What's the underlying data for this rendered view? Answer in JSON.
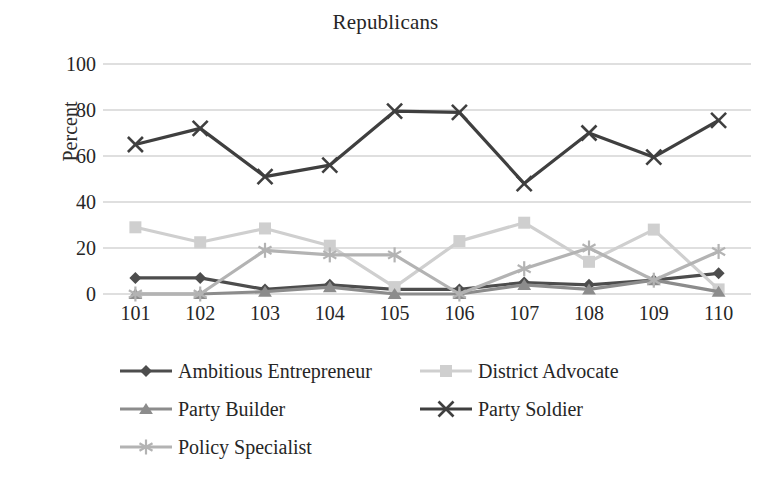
{
  "chart_data": {
    "type": "line",
    "title": "Republicans",
    "xlabel": "",
    "ylabel": "Percent",
    "ylim": [
      0,
      100
    ],
    "yticks": [
      0,
      20,
      40,
      60,
      80,
      100
    ],
    "grid": true,
    "legend_position": "bottom",
    "categories": [
      "101",
      "102",
      "103",
      "104",
      "105",
      "106",
      "107",
      "108",
      "109",
      "110"
    ],
    "series": [
      {
        "name": "Ambitious Entrepreneur",
        "marker": "diamond",
        "color": "#4d4d4d",
        "values": [
          7,
          7,
          2,
          4,
          2,
          2,
          5,
          4,
          6,
          9
        ]
      },
      {
        "name": "District Advocate",
        "marker": "square",
        "color": "#cfcfcf",
        "values": [
          29,
          22.5,
          28.5,
          21,
          3,
          23,
          31,
          14,
          28,
          2
        ]
      },
      {
        "name": "Party Builder",
        "marker": "triangle",
        "color": "#8c8c8c",
        "values": [
          0,
          0,
          1,
          3,
          0,
          0,
          4,
          2,
          6,
          1
        ]
      },
      {
        "name": "Party Soldier",
        "marker": "cross",
        "color": "#3f3f3f",
        "values": [
          65,
          72,
          51,
          56,
          79.5,
          79,
          48,
          70,
          59.5,
          75.5
        ]
      },
      {
        "name": "Policy Specialist",
        "marker": "asterisk",
        "color": "#b3b3b3",
        "values": [
          0,
          0,
          19,
          17,
          17,
          0,
          11,
          20,
          6,
          18.5
        ]
      }
    ]
  },
  "axis": {
    "y_tick_labels": [
      "100",
      "80",
      "60",
      "40",
      "20",
      "0"
    ],
    "x_tick_labels": [
      "101",
      "102",
      "103",
      "104",
      "105",
      "106",
      "107",
      "108",
      "109",
      "110"
    ]
  },
  "colors": {
    "gridline": "#bfbfbf",
    "text": "#262626",
    "background": "#ffffff"
  }
}
